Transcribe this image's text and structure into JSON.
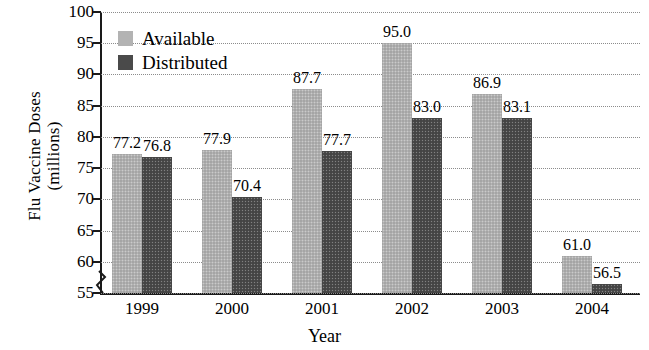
{
  "chart_data": {
    "type": "bar",
    "title": "",
    "xlabel": "Year",
    "ylabel": "Flu Vaccine Doses (millions)",
    "ylabel_line1": "Flu Vaccine Doses",
    "ylabel_line2": "(millions)",
    "categories": [
      "1999",
      "2000",
      "2001",
      "2002",
      "2003",
      "2004"
    ],
    "series": [
      {
        "name": "Available",
        "color": "#b3b3b3",
        "values": [
          77.2,
          77.9,
          87.7,
          95.0,
          86.9,
          61.0
        ]
      },
      {
        "name": "Distributed",
        "color": "#4a4a4a",
        "values": [
          76.8,
          70.4,
          77.7,
          83.0,
          83.1,
          56.5
        ]
      }
    ],
    "value_labels": [
      [
        "77.2",
        "77.9",
        "87.7",
        "95.0",
        "86.9",
        "61.0"
      ],
      [
        "76.8",
        "70.4",
        "77.7",
        "83.0",
        "83.1",
        "56.5"
      ]
    ],
    "ylim": [
      55,
      100
    ],
    "yticks": [
      100,
      95,
      90,
      85,
      80,
      75,
      70,
      65,
      60,
      55
    ],
    "ytick_labels": [
      "100",
      "95",
      "90",
      "85",
      "80",
      "75",
      "70",
      "65",
      "60",
      "55"
    ],
    "grid": true,
    "axis_break": true,
    "legend_position": "top-left",
    "legend": [
      "Available",
      "Distributed"
    ]
  }
}
